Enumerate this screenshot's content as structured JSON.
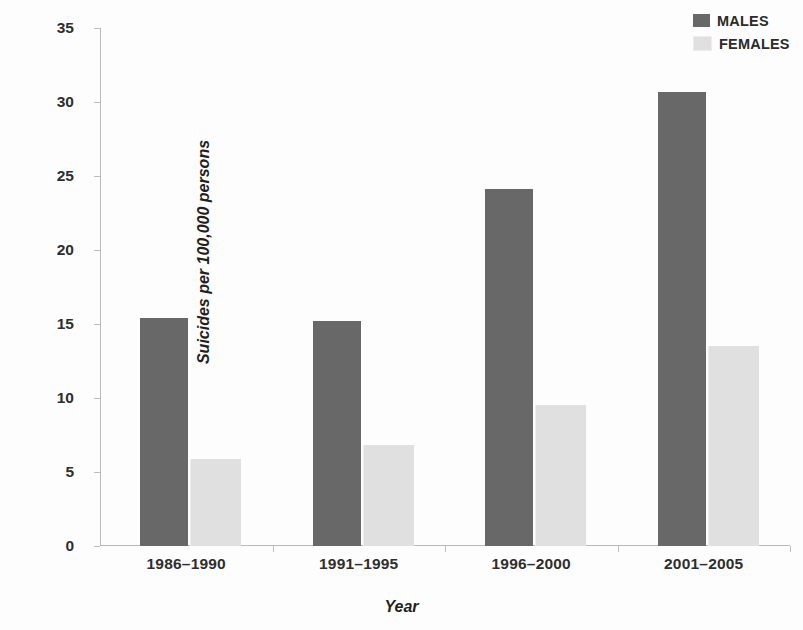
{
  "chart_data": {
    "type": "bar",
    "title": "",
    "xlabel": "Year",
    "ylabel": "Suicides per 100,000 persons",
    "categories": [
      "1986–1990",
      "1991–1995",
      "1996–2000",
      "2001–2005"
    ],
    "series": [
      {
        "name": "MALES",
        "color": "#686868",
        "values": [
          15.4,
          15.2,
          24.1,
          30.7
        ]
      },
      {
        "name": "FEMALES",
        "color": "#e0e0e0",
        "values": [
          5.9,
          6.8,
          9.5,
          13.5
        ]
      }
    ],
    "ylim": [
      0,
      35
    ],
    "yticks": [
      0,
      5,
      10,
      15,
      20,
      25,
      30,
      35
    ],
    "ytick_labels": [
      "0",
      "5",
      "10",
      "15",
      "20",
      "25",
      "30",
      "35"
    ],
    "grid": false,
    "legend_position": "top-right"
  },
  "legend": {
    "items": [
      {
        "label": "MALES",
        "color": "#686868"
      },
      {
        "label": "FEMALES",
        "color": "#e0e0e0"
      }
    ]
  }
}
